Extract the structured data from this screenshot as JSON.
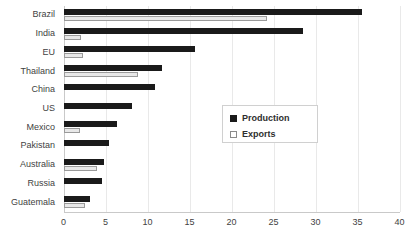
{
  "chart_data": {
    "type": "bar",
    "orientation": "horizontal",
    "title": "",
    "xlabel": "",
    "ylabel": "",
    "xlim": [
      0,
      40
    ],
    "xticks": [
      "0",
      "5",
      "10",
      "15",
      "20",
      "25",
      "30",
      "35",
      "40"
    ],
    "grid": true,
    "legend_position": "center-right",
    "categories": [
      "Brazil",
      "India",
      "EU",
      "Thailand",
      "China",
      "US",
      "Mexico",
      "Pakistan",
      "Australia",
      "Russia",
      "Guatemala"
    ],
    "series": [
      {
        "name": "Production",
        "color": "#1a1a1a",
        "values": [
          35.5,
          28.5,
          15.7,
          11.7,
          10.9,
          8.1,
          6.4,
          5.4,
          4.8,
          4.6,
          3.1
        ]
      },
      {
        "name": "Exports",
        "color": "#e8e8e8",
        "values": [
          24.2,
          2.1,
          2.3,
          8.9,
          0,
          0,
          2.0,
          0,
          4.0,
          0,
          2.6
        ]
      }
    ]
  },
  "legend": {
    "items": [
      {
        "label": "Production",
        "swatch": "filled-dark-square-icon"
      },
      {
        "label": "Exports",
        "swatch": "outlined-light-square-icon"
      }
    ]
  }
}
